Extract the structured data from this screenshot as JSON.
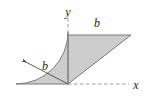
{
  "figure": {
    "canvas": {
      "width": 143,
      "height": 102,
      "background": "#ffffff"
    },
    "colors": {
      "fill": "#cdcdcd",
      "outline": "#6f6f6f",
      "axis": "#9a9a9a",
      "label": "#231f20"
    },
    "axes": {
      "origin": {
        "x": 68,
        "y": 84
      },
      "x_axis": {
        "label": "x",
        "label_pos": {
          "x": 135,
          "y": 88
        },
        "from": {
          "x": 68,
          "y": 84
        },
        "to": {
          "x": 129,
          "y": 84
        },
        "style": "dashed"
      },
      "y_axis": {
        "label": "y",
        "label_pos": {
          "x": 68,
          "y": 12
        },
        "from": {
          "x": 68,
          "y": 84
        },
        "to": {
          "x": 68,
          "y": 18
        },
        "style": "dashed"
      }
    },
    "dimensions": [
      {
        "id": "triangle-top",
        "label": "b",
        "label_pos": {
          "x": 97,
          "y": 23
        },
        "describes": "top horizontal edge of triangle"
      },
      {
        "id": "sector-radius",
        "label": "b",
        "label_pos": {
          "x": 45,
          "y": 66
        },
        "describes": "radius of quarter circular sector",
        "arrow_from": {
          "x": 68,
          "y": 84
        },
        "arrow_to": {
          "x": 22,
          "y": 60
        }
      }
    ],
    "shapes": [
      {
        "id": "quarter-sector",
        "kind": "circular-sector",
        "center": {
          "x": 68,
          "y": 84
        },
        "radius": 52,
        "start_angle_deg": 90,
        "end_angle_deg": 180
      },
      {
        "id": "right-triangle",
        "kind": "triangle",
        "vertices": [
          {
            "x": 68,
            "y": 84
          },
          {
            "x": 68,
            "y": 35
          },
          {
            "x": 131,
            "y": 35
          }
        ]
      }
    ]
  }
}
